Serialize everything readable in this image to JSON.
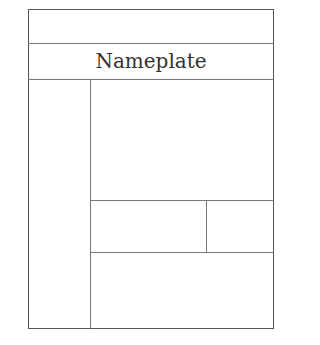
{
  "diagram": {
    "type": "page-layout-wireframe",
    "nameplate_label": "Nameplate",
    "regions": [
      {
        "id": "masthead-top",
        "label": ""
      },
      {
        "id": "nameplate",
        "label": "Nameplate"
      },
      {
        "id": "left-column",
        "label": ""
      },
      {
        "id": "main-story",
        "label": ""
      },
      {
        "id": "secondary-left",
        "label": ""
      },
      {
        "id": "secondary-right",
        "label": ""
      },
      {
        "id": "bottom-story",
        "label": ""
      }
    ],
    "colors": {
      "line": "#777777",
      "frame": "#555555",
      "text": "#333333",
      "background": "#ffffff"
    }
  }
}
